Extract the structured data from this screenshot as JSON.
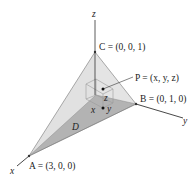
{
  "figure": {
    "axes": {
      "x_label": "x",
      "y_label": "y",
      "z_label": "z"
    },
    "vertices": {
      "A": {
        "name": "A",
        "label": "A = (3, 0, 0)"
      },
      "B": {
        "name": "B",
        "label": "B = (0, 1, 0)"
      },
      "C": {
        "name": "C",
        "label": "C = (0, 0, 1)"
      }
    },
    "point": {
      "label": "P = (x, y, z)"
    },
    "coordinate_labels": {
      "x": "x",
      "y": "y",
      "z": "z"
    },
    "region_label": "D",
    "colors": {
      "base_triangle": "#a9a9a9",
      "side_faces": "#d9d9d9",
      "axis": "#333333",
      "box": "#9a9a9a"
    }
  }
}
